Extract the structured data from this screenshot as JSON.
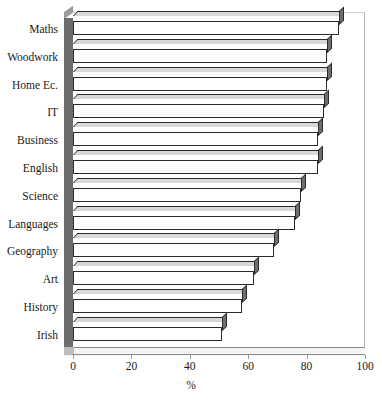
{
  "chart_data": {
    "type": "bar",
    "orientation": "horizontal",
    "title": "",
    "xlabel": "%",
    "ylabel": "",
    "xlim": [
      0,
      100
    ],
    "xticks": [
      0,
      20,
      40,
      60,
      80,
      100
    ],
    "grid": false,
    "legend": false,
    "style": "3d-horizontal-bar",
    "categories": [
      "Maths",
      "Woodwork",
      "Home Ec.",
      "IT",
      "Business",
      "English",
      "Science",
      "Languages",
      "Geography",
      "Art",
      "History",
      "Irish"
    ],
    "values": [
      91,
      87,
      87,
      86,
      84,
      84,
      78,
      76,
      69,
      62,
      58,
      51
    ],
    "series": [
      {
        "name": "",
        "values": [
          91,
          87,
          87,
          86,
          84,
          84,
          78,
          76,
          69,
          62,
          58,
          51
        ]
      }
    ]
  },
  "colors": {
    "bar_face": "#ffffff",
    "bar_outline": "#2b2b2b",
    "bar_side": "#6e6e6e",
    "bar_top": "#d8d8d8",
    "wall": "#6d6d6d",
    "axis": "#8d8d8d",
    "text": "#1a1a1a",
    "background": "#ffffff"
  },
  "axis": {
    "x_title": "%",
    "tick_labels": [
      "0",
      "20",
      "40",
      "60",
      "80",
      "100"
    ]
  },
  "header": {
    "clipped_title": ""
  }
}
